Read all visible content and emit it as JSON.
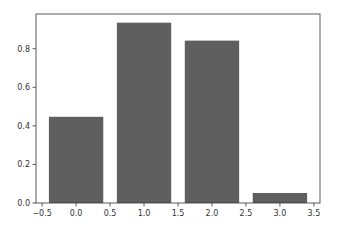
{
  "chart_data": {
    "type": "bar",
    "title": "",
    "xlabel": "",
    "ylabel": "",
    "x": [
      0,
      1,
      2,
      3
    ],
    "categories": [
      "0",
      "1",
      "2",
      "3"
    ],
    "values": [
      0.447,
      0.935,
      0.842,
      0.052
    ],
    "bar_width": 0.8,
    "bar_color": "#5f5f5f",
    "xlim": [
      -0.59,
      3.59
    ],
    "ylim": [
      0,
      0.98
    ],
    "xticks": [
      -0.5,
      0.0,
      0.5,
      1.0,
      1.5,
      2.0,
      2.5,
      3.0,
      3.5
    ],
    "xtick_labels": [
      "−0.5",
      "0.0",
      "0.5",
      "1.0",
      "1.5",
      "2.0",
      "2.5",
      "3.0",
      "3.5"
    ],
    "yticks": [
      0.0,
      0.2,
      0.4,
      0.6,
      0.8
    ],
    "ytick_labels": [
      "0.0",
      "0.2",
      "0.4",
      "0.6",
      "0.8"
    ],
    "grid": false,
    "legend": null
  },
  "layout": {
    "plot_left": 36,
    "plot_top": 14,
    "plot_right": 320,
    "plot_bottom": 203
  }
}
